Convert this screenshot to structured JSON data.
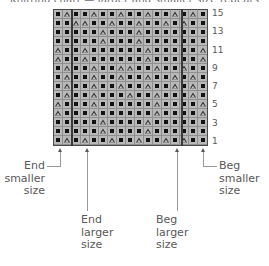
{
  "title": "Knitting chart — larger and smaller size repeats",
  "chart_data": {
    "type": "table",
    "title": "Knitting chart — larger and smaller size repeats",
    "xlabel": "",
    "ylabel": "Row",
    "columns": 17,
    "rows": 15,
    "row_labels": [
      "15",
      "13",
      "11",
      "9",
      "7",
      "5",
      "3",
      "1"
    ],
    "row_label_numbers": [
      15,
      13,
      11,
      9,
      7,
      5,
      3,
      1
    ],
    "legend": [
      {
        "symbol": "square",
        "name": "filled-square-stitch"
      },
      {
        "symbol": "triangle",
        "name": "open-triangle-stitch"
      }
    ],
    "section_markers": [
      {
        "name": "end-smaller-size",
        "column": 1
      },
      {
        "name": "end-larger-size",
        "column": 3
      },
      {
        "name": "beg-larger-size",
        "column": 15
      },
      {
        "name": "beg-smaller-size",
        "column": 17
      }
    ],
    "grid": [
      [
        "sq",
        "tri",
        "sq",
        "sq",
        "tri",
        "sq",
        "sq",
        "tri",
        "sq",
        "sq",
        "tri",
        "sq",
        "sq",
        "tri",
        "sq",
        "tri",
        "sq"
      ],
      [
        "sq",
        "sq",
        "tri",
        "tri",
        "sq",
        "sq",
        "tri",
        "sq",
        "sq",
        "tri",
        "sq",
        "sq",
        "tri",
        "sq",
        "tri",
        "sq",
        "sq"
      ],
      [
        "sq",
        "sq",
        "sq",
        "sq",
        "sq",
        "tri",
        "sq",
        "sq",
        "sq",
        "tri",
        "sq",
        "sq",
        "sq",
        "sq",
        "sq",
        "sq",
        "sq"
      ],
      [
        "sq",
        "sq",
        "sq",
        "sq",
        "sq",
        "tri",
        "sq",
        "sq",
        "sq",
        "tri",
        "sq",
        "sq",
        "sq",
        "sq",
        "sq",
        "sq",
        "sq"
      ],
      [
        "tri",
        "sq",
        "sq",
        "tri",
        "sq",
        "sq",
        "sq",
        "sq",
        "sq",
        "sq",
        "tri",
        "sq",
        "sq",
        "sq",
        "sq",
        "sq",
        "tri"
      ],
      [
        "tri",
        "sq",
        "sq",
        "tri",
        "sq",
        "sq",
        "sq",
        "sq",
        "sq",
        "sq",
        "tri",
        "sq",
        "sq",
        "sq",
        "sq",
        "sq",
        "tri"
      ],
      [
        "sq",
        "tri",
        "sq",
        "sq",
        "tri",
        "sq",
        "sq",
        "tri",
        "tri",
        "sq",
        "sq",
        "tri",
        "sq",
        "sq",
        "tri",
        "sq",
        "sq"
      ],
      [
        "sq",
        "tri",
        "sq",
        "sq",
        "tri",
        "sq",
        "sq",
        "tri",
        "sq",
        "sq",
        "tri",
        "sq",
        "sq",
        "tri",
        "sq",
        "tri",
        "sq"
      ],
      [
        "sq",
        "tri",
        "sq",
        "sq",
        "tri",
        "sq",
        "sq",
        "tri",
        "sq",
        "sq",
        "tri",
        "sq",
        "sq",
        "tri",
        "sq",
        "tri",
        "sq"
      ],
      [
        "sq",
        "tri",
        "sq",
        "sq",
        "tri",
        "sq",
        "sq",
        "sq",
        "tri",
        "sq",
        "sq",
        "tri",
        "sq",
        "sq",
        "sq",
        "tri",
        "sq"
      ],
      [
        "tri",
        "sq",
        "sq",
        "sq",
        "tri",
        "sq",
        "sq",
        "sq",
        "sq",
        "sq",
        "sq",
        "tri",
        "sq",
        "sq",
        "sq",
        "sq",
        "tri"
      ],
      [
        "tri",
        "sq",
        "sq",
        "sq",
        "tri",
        "sq",
        "sq",
        "sq",
        "sq",
        "sq",
        "sq",
        "tri",
        "sq",
        "sq",
        "sq",
        "sq",
        "tri"
      ],
      [
        "sq",
        "sq",
        "sq",
        "sq",
        "sq",
        "tri",
        "sq",
        "sq",
        "sq",
        "sq",
        "tri",
        "sq",
        "sq",
        "sq",
        "sq",
        "sq",
        "sq"
      ],
      [
        "sq",
        "sq",
        "sq",
        "sq",
        "sq",
        "tri",
        "sq",
        "sq",
        "sq",
        "sq",
        "tri",
        "sq",
        "sq",
        "sq",
        "sq",
        "sq",
        "sq"
      ],
      [
        "sq",
        "tri",
        "sq",
        "tri",
        "sq",
        "sq",
        "tri",
        "sq",
        "sq",
        "tri",
        "sq",
        "sq",
        "tri",
        "sq",
        "tri",
        "sq",
        "sq"
      ]
    ]
  },
  "callouts": {
    "end_smaller": {
      "line1": "End",
      "line2": "smaller",
      "line3": "size"
    },
    "end_larger": {
      "line1": "End",
      "line2": "larger",
      "line3": "size"
    },
    "beg_larger": {
      "line1": "Beg",
      "line2": "larger",
      "line3": "size"
    },
    "beg_smaller": {
      "line1": "Beg",
      "line2": "smaller",
      "line3": "size"
    }
  }
}
